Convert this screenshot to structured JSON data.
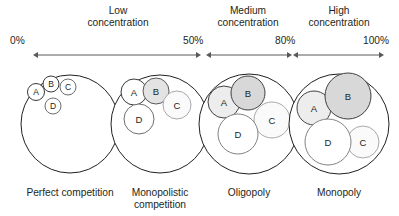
{
  "figure": {
    "bands": [
      {
        "name": "low-concentration",
        "label_line1": "Low",
        "label_line2": "concentration",
        "start_label": "0%",
        "end_label": "50%",
        "label_x": 118,
        "arrow_x1": 38,
        "arrow_x2": 196,
        "start_label_x": 10,
        "end_label_x": 183
      },
      {
        "name": "medium-concentration",
        "label_line1": "Medium",
        "label_line2": "concentration",
        "start_label": "50%",
        "end_label": "80%",
        "label_x": 248,
        "arrow_x1": 211,
        "arrow_x2": 287,
        "start_label_x": 183,
        "end_label_x": 275
      },
      {
        "name": "high-concentration",
        "label_line1": "High",
        "label_line2": "concentration",
        "start_label": "80%",
        "end_label": "100%",
        "label_x": 339,
        "arrow_x1": 298,
        "arrow_x2": 379,
        "start_label_x": 275,
        "end_label_x": 363
      }
    ],
    "axis": {
      "band_label_line1_y": 14,
      "band_label_line2_y": 26,
      "tick_label_y": 44,
      "arrow_y": 55
    },
    "markets": [
      {
        "name": "perfect-competition",
        "label": "Perfect competition",
        "label_x": 70,
        "label_lines": [
          "Perfect competition"
        ],
        "market_circle": {
          "cx": 70,
          "cy": 124,
          "r": 49
        },
        "firms": [
          {
            "id": "A",
            "cx": 36,
            "cy": 92,
            "r": 8.5,
            "fill": "#ffffff",
            "stroke": "#3a3a3a",
            "font_size": 8.5
          },
          {
            "id": "B",
            "cx": 51,
            "cy": 84,
            "r": 8.0,
            "fill": "#ffffff",
            "stroke": "#3a3a3a",
            "font_size": 8.5
          },
          {
            "id": "C",
            "cx": 68,
            "cy": 87,
            "r": 8.0,
            "fill": "#ffffff",
            "stroke": "#6d6e71",
            "font_size": 8.5
          },
          {
            "id": "D",
            "cx": 53,
            "cy": 106,
            "r": 8.0,
            "fill": "#ffffff",
            "stroke": "#6d6e71",
            "font_size": 8.5
          }
        ]
      },
      {
        "name": "monopolistic-competition",
        "label": "Monopolistic competition",
        "label_x": 160,
        "label_lines": [
          "Monopolistic",
          "competition"
        ],
        "market_circle": {
          "cx": 160,
          "cy": 124,
          "r": 49
        },
        "firms": [
          {
            "id": "A",
            "cx": 134,
            "cy": 92,
            "r": 13,
            "fill": "#ffffff",
            "stroke": "#3a3a3a",
            "font_size": 9.5
          },
          {
            "id": "B",
            "cx": 156,
            "cy": 91,
            "r": 13,
            "fill": "#e3e3e3",
            "stroke": "#58595b",
            "font_size": 9.5
          },
          {
            "id": "C",
            "cx": 177,
            "cy": 105,
            "r": 14,
            "fill": "#fafafa",
            "stroke": "#a7a9ac",
            "font_size": 9.5
          },
          {
            "id": "D",
            "cx": 139,
            "cy": 119,
            "r": 15,
            "fill": "#ffffff",
            "stroke": "#6d6e71",
            "font_size": 9.5
          }
        ]
      },
      {
        "name": "oligopoly",
        "label": "Oligopoly",
        "label_x": 249,
        "label_lines": [
          "Oligopoly"
        ],
        "market_circle": {
          "cx": 249,
          "cy": 124,
          "r": 50
        },
        "firms": [
          {
            "id": "A",
            "cx": 224,
            "cy": 102,
            "r": 16,
            "fill": "#ededed",
            "stroke": "#404040",
            "font_size": 9.5
          },
          {
            "id": "B",
            "cx": 248,
            "cy": 93,
            "r": 17,
            "fill": "#d8d8d8",
            "stroke": "#404040",
            "font_size": 9.5
          },
          {
            "id": "C",
            "cx": 272,
            "cy": 120,
            "r": 18,
            "fill": "#fafafa",
            "stroke": "#a7a9ac",
            "font_size": 9.5
          },
          {
            "id": "D",
            "cx": 238,
            "cy": 134,
            "r": 20,
            "fill": "#ffffff",
            "stroke": "#808285",
            "font_size": 9.5
          }
        ]
      },
      {
        "name": "monopoly",
        "label": "Monopoly",
        "label_x": 339,
        "label_lines": [
          "Monopoly"
        ],
        "market_circle": {
          "cx": 339,
          "cy": 124,
          "r": 50
        },
        "firms": [
          {
            "id": "A",
            "cx": 314,
            "cy": 108,
            "r": 17,
            "fill": "#ededed",
            "stroke": "#404040",
            "font_size": 9.5
          },
          {
            "id": "B",
            "cx": 348,
            "cy": 96,
            "r": 23,
            "fill": "#d8d8d8",
            "stroke": "#404040",
            "font_size": 9.5
          },
          {
            "id": "C",
            "cx": 363,
            "cy": 142,
            "r": 16,
            "fill": "#fafafa",
            "stroke": "#a7a9ac",
            "font_size": 9.5
          },
          {
            "id": "D",
            "cx": 328,
            "cy": 142,
            "r": 23,
            "fill": "#ffffff",
            "stroke": "#808285",
            "font_size": 9.5
          }
        ]
      }
    ],
    "market_label_y": 196,
    "market_label_line_height": 12,
    "colors": {
      "text": "#231f20",
      "axis": "#58595b",
      "outline": "#231f20"
    }
  }
}
